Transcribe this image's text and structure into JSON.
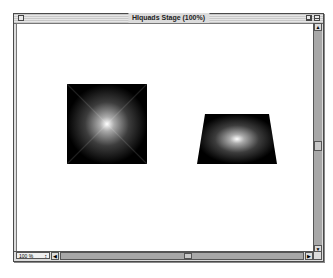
{
  "window": {
    "title": "HIquads Stage (100%)"
  },
  "stage": {
    "shapes": [
      {
        "name": "square-quad",
        "type": "square",
        "fill": "radial-gradient-black-to-white"
      },
      {
        "name": "trapezoid-quad",
        "type": "trapezoid",
        "fill": "radial-gradient-black-to-white"
      }
    ]
  },
  "statusbar": {
    "zoom_value": "100 %",
    "zoom_stepper": "↕"
  },
  "icons": {
    "arrow_up": "▲",
    "arrow_down": "▼",
    "arrow_left": "◀",
    "arrow_right": "▶"
  }
}
